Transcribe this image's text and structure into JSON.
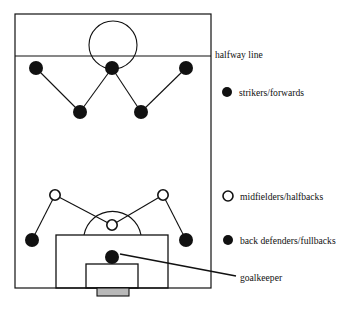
{
  "diagram": {
    "type": "soccer-formation-field-diagram",
    "title": "",
    "field": {
      "outline": {
        "x": 15,
        "y": 14,
        "width": 196,
        "height": 274
      },
      "halfway_line_y": 56,
      "center_circle": {
        "cx": 113,
        "cy": 45,
        "r": 24
      },
      "penalty_box": {
        "x": 56,
        "y": 235,
        "width": 112,
        "height": 53
      },
      "goal_area": {
        "x": 86,
        "y": 264,
        "width": 52,
        "height": 24
      },
      "goal": {
        "x": 97,
        "y": 288,
        "width": 32,
        "height": 8
      },
      "penalty_arc": {
        "cx": 112,
        "cy": 247,
        "r": 29
      }
    },
    "stroke_color": "#111111",
    "fill_marker_color": "#111111",
    "open_marker_color": "#ffffff"
  },
  "labels": {
    "halfway_line": "halfway line",
    "goalkeeper": "goalkeeper"
  },
  "legend": {
    "items": [
      {
        "key": "strikers",
        "marker": "filled-circle",
        "label": "strikers/forwards",
        "x": 227,
        "y": 92
      },
      {
        "key": "midfielders",
        "marker": "open-circle",
        "label": "midfielders/halfbacks",
        "x": 228,
        "y": 196
      },
      {
        "key": "defenders",
        "marker": "filled-circle",
        "label": "back defenders/fullbacks",
        "x": 228,
        "y": 240
      }
    ]
  },
  "players": {
    "forwards": [
      {
        "x": 36,
        "y": 68,
        "marker": "filled"
      },
      {
        "x": 112,
        "y": 68,
        "marker": "filled"
      },
      {
        "x": 186,
        "y": 68,
        "marker": "filled"
      },
      {
        "x": 80,
        "y": 112,
        "marker": "filled"
      },
      {
        "x": 141,
        "y": 112,
        "marker": "filled"
      }
    ],
    "midfielders": [
      {
        "x": 55,
        "y": 195,
        "marker": "open"
      },
      {
        "x": 163,
        "y": 195,
        "marker": "open"
      },
      {
        "x": 112,
        "y": 225,
        "marker": "open"
      }
    ],
    "defenders": [
      {
        "x": 32,
        "y": 240,
        "marker": "filled"
      },
      {
        "x": 186,
        "y": 240,
        "marker": "filled"
      }
    ],
    "goalkeeper": {
      "x": 112,
      "y": 257,
      "marker": "filled"
    }
  },
  "connectors": {
    "forward_links": [
      {
        "x1": 36,
        "y1": 68,
        "x2": 80,
        "y2": 112
      },
      {
        "x1": 112,
        "y1": 68,
        "x2": 80,
        "y2": 112
      },
      {
        "x1": 112,
        "y1": 68,
        "x2": 141,
        "y2": 112
      },
      {
        "x1": 186,
        "y1": 68,
        "x2": 141,
        "y2": 112
      }
    ],
    "mid_links": [
      {
        "x1": 55,
        "y1": 195,
        "x2": 32,
        "y2": 240
      },
      {
        "x1": 55,
        "y1": 195,
        "x2": 112,
        "y2": 225
      },
      {
        "x1": 163,
        "y1": 195,
        "x2": 112,
        "y2": 225
      },
      {
        "x1": 163,
        "y1": 195,
        "x2": 186,
        "y2": 240
      }
    ],
    "goalkeeper_leader": {
      "x1": 120,
      "y1": 254,
      "x2": 236,
      "y2": 276
    }
  },
  "marker_sizes": {
    "player_radius": 7,
    "legend_filled_radius": 5,
    "legend_open_radius": 5,
    "open_stroke_width": 1.6
  }
}
